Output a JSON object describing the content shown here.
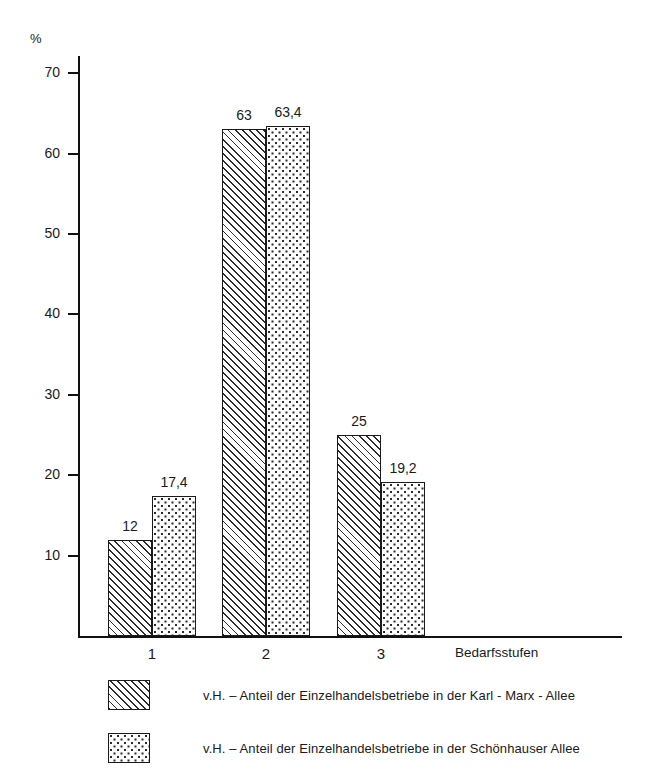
{
  "chart_data": {
    "type": "bar",
    "title": "",
    "subtitle": "",
    "xlabel": "Bedarfsstufen",
    "ylabel": "%",
    "categories": [
      "1",
      "2",
      "3"
    ],
    "series": [
      {
        "name": "v.H. – Anteil der Einzelhandelsbetriebe in der Karl-Marx-Allee",
        "pattern": "diagonal-hatch",
        "values": [
          12,
          63,
          25
        ],
        "value_labels": [
          "12",
          "63",
          "25"
        ]
      },
      {
        "name": "v.H. – Anteil der Einzelhandelsbetriebe in der Schönhauser Allee",
        "pattern": "dots",
        "values": [
          17.4,
          63.4,
          19.2
        ],
        "value_labels": [
          "17,4",
          "63,4",
          "19,2"
        ]
      }
    ],
    "ylim": [
      0,
      72
    ],
    "yticks": [
      10,
      20,
      30,
      40,
      50,
      60,
      70
    ],
    "ytick_labels": [
      "10",
      "20",
      "30",
      "40",
      "50",
      "60",
      "70"
    ],
    "grid": false,
    "legend_position": "bottom-left",
    "colors": {
      "ink": "#1a1a1a",
      "background": "#ffffff",
      "pattern": "#2b2b2b"
    }
  },
  "axis": {
    "unit_label": "%",
    "x_title": "Bedarfsstufen"
  },
  "legend": {
    "items": [
      {
        "swatch": "diagonal-hatch-swatch",
        "label": "v.H. – Anteil der Einzelhandelsbetriebe in der Karl - Marx - Allee"
      },
      {
        "swatch": "dotted-swatch",
        "label": "v.H. – Anteil der Einzelhandelsbetriebe in der Schönhauser Allee"
      }
    ]
  }
}
